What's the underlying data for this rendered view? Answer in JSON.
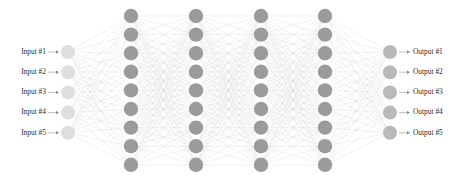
{
  "diagram": {
    "background_color": "#ffffff",
    "width": 463,
    "height": 184
  },
  "labels": {
    "inputs": [
      "Input #1",
      "Input #2",
      "Input #3",
      "Input #4",
      "Input #5"
    ],
    "outputs": [
      "Output #1",
      "Output #2",
      "Output #3",
      "Output #4",
      "Output #5"
    ],
    "arrow_glyph": "→"
  },
  "chart_data": {
    "type": "diagram",
    "layers": [
      {
        "name": "input-layer",
        "kind": "input",
        "node_count": 5,
        "node_color": "#dedede",
        "center_x": 68,
        "first_node_y": 52,
        "node_spacing": 20.2,
        "node_radius": 7.0
      },
      {
        "name": "hidden-layer-1",
        "kind": "hidden",
        "node_count": 9,
        "node_color": "#9b9b9b",
        "center_x": 131,
        "first_node_y": 16,
        "node_spacing": 18.6,
        "node_radius": 7.2
      },
      {
        "name": "hidden-layer-2",
        "kind": "hidden",
        "node_count": 9,
        "node_color": "#9b9b9b",
        "center_x": 196,
        "first_node_y": 16,
        "node_spacing": 18.6,
        "node_radius": 7.2
      },
      {
        "name": "hidden-layer-3",
        "kind": "hidden",
        "node_count": 9,
        "node_color": "#9b9b9b",
        "center_x": 261,
        "first_node_y": 16,
        "node_spacing": 18.6,
        "node_radius": 7.2
      },
      {
        "name": "hidden-layer-4",
        "kind": "hidden",
        "node_count": 9,
        "node_color": "#9b9b9b",
        "center_x": 325,
        "first_node_y": 16,
        "node_spacing": 18.6,
        "node_radius": 7.2
      },
      {
        "name": "output-layer",
        "kind": "output",
        "node_count": 5,
        "node_color": "#b9b9b9",
        "center_x": 390,
        "first_node_y": 52,
        "node_spacing": 20.2,
        "node_radius": 7.0
      }
    ],
    "connections": {
      "style": "fully-connected-adjacent-layers",
      "color": "#c6c6c6",
      "opacity": 0.62,
      "stroke_width": 0.38,
      "total_edges": 369
    },
    "label_arrows": {
      "input_arrow_x_start": 48,
      "input_arrow_x_end": 59,
      "output_arrow_x_start": 399,
      "output_arrow_x_end": 410,
      "color": "#8a8a8a"
    },
    "label_text": {
      "input_text_x": 46,
      "output_text_x": 413,
      "font_size": 7.4,
      "color": "#2b2b2b"
    }
  },
  "colors": {
    "background": "#ffffff",
    "input_node": "#dedede",
    "hidden_node": "#9b9b9b",
    "output_node": "#b9b9b9",
    "edge": "#c6c6c6",
    "text": "#2b2b2b",
    "arrow": "#8a8a8a"
  }
}
